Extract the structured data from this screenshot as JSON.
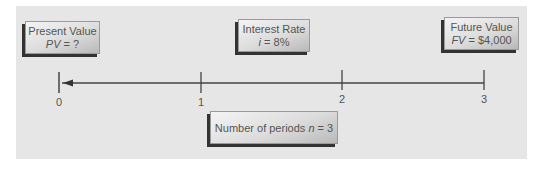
{
  "diagram": {
    "boxes": {
      "present_value": {
        "title": "Present Value",
        "var": "PV",
        "expr": " = ?"
      },
      "interest_rate": {
        "title": "Interest Rate",
        "var": "i",
        "expr": " = 8%"
      },
      "future_value": {
        "title": "Future Value",
        "var": "FV",
        "expr": " = $4,000"
      },
      "periods": {
        "title": "Number of periods ",
        "var": "n",
        "expr": " = 3"
      }
    },
    "timeline": {
      "ticks": [
        "0",
        "1",
        "2",
        "3"
      ],
      "arrow_direction": "toward-0"
    },
    "colors": {
      "panel": "#e6e6e6",
      "line": "#444444",
      "box_shadow": "#333333",
      "text": "#555555"
    }
  }
}
